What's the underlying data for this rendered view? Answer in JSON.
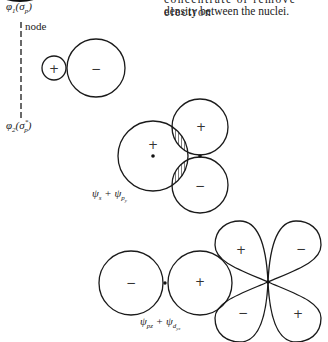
{
  "text": {
    "top_line_partial": "concentrate or remove electron",
    "top_line_2": "density between the nuclei."
  },
  "labels": {
    "phi1": {
      "symbol": "φ",
      "sub": "1",
      "paren": "(σ",
      "paren_sub": "p",
      "close": ")"
    },
    "node": "node",
    "phi2": {
      "symbol": "φ",
      "sub": "2",
      "paren": "(σ",
      "paren_sup": "*",
      "paren_sub": "p",
      "close": ")"
    },
    "combo1": {
      "a": "ψ",
      "a_sub": "s",
      "plus": " + ",
      "b": "ψ",
      "b_sub": "p",
      "b_sub2": "y"
    },
    "combo2": {
      "a": "ψ",
      "a_sub": "pz",
      "plus": " + ",
      "b": "ψ",
      "b_sub": "d",
      "b_sub2": "yz"
    }
  },
  "signs": {
    "fig1_small_lobe": "+",
    "fig1_large_lobe": "−",
    "fig2_s_orbital": "+",
    "fig2_p_top": "+",
    "fig2_p_bottom": "−",
    "fig3_p_left": "−",
    "fig3_p_right": "+",
    "fig3_d_upper_left": "+",
    "fig3_d_upper_right": "−",
    "fig3_d_lower_left": "−",
    "fig3_d_lower_right": "+"
  },
  "colors": {
    "line": "#1a1a1a",
    "hatch": "#444444",
    "background": "#ffffff"
  }
}
